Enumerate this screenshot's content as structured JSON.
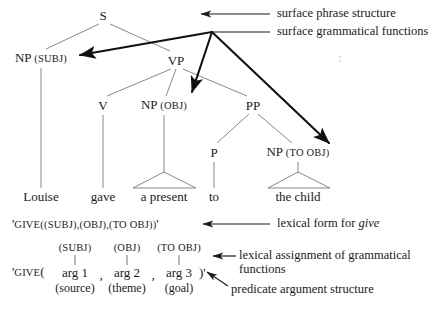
{
  "figure": {
    "type": "lfg-phrase-structure-diagram",
    "colors": {
      "ink": "#1a1a1a",
      "thin_line": "#7a7a7a",
      "thick_line": "#111111",
      "background": "#ffffff"
    }
  },
  "tree": {
    "nodes": [
      {
        "id": "S",
        "label": "S",
        "gf": "",
        "x": 103,
        "y": 15
      },
      {
        "id": "NP_SUBJ",
        "label": "NP",
        "gf": "(SUBJ)",
        "x": 41,
        "y": 58
      },
      {
        "id": "VP",
        "label": "VP",
        "gf": "",
        "x": 176,
        "y": 60
      },
      {
        "id": "V",
        "label": "V",
        "gf": "",
        "x": 103,
        "y": 105
      },
      {
        "id": "NP_OBJ",
        "label": "NP",
        "gf": "(OBJ)",
        "x": 164,
        "y": 105
      },
      {
        "id": "PP",
        "label": "PP",
        "gf": "",
        "x": 253,
        "y": 105
      },
      {
        "id": "P",
        "label": "P",
        "gf": "",
        "x": 214,
        "y": 152
      },
      {
        "id": "NP_TOOBJ",
        "label": "NP",
        "gf": "(TO OBJ)",
        "x": 298,
        "y": 152
      }
    ],
    "words": [
      {
        "id": "w_louise",
        "text": "Louise",
        "x": 41,
        "y": 196
      },
      {
        "id": "w_gave",
        "text": "gave",
        "x": 103,
        "y": 196
      },
      {
        "id": "w_present",
        "text": "a present",
        "x": 164,
        "y": 196
      },
      {
        "id": "w_to",
        "text": "to",
        "x": 214,
        "y": 196
      },
      {
        "id": "w_child",
        "text": "the child",
        "x": 298,
        "y": 196
      }
    ]
  },
  "lexical_form": {
    "prefix": "'",
    "predicate": "GIVE",
    "args": "((SUBJ),(OBJ),(TO OBJ))",
    "suffix": "'",
    "x": 12,
    "y": 224
  },
  "predicate_argument_structure": {
    "prefix": "'",
    "predicate": "GIVE",
    "open_paren": "(",
    "close_paren": ")",
    "suffix": "'",
    "separator": ",",
    "x": 12,
    "y": 272,
    "columns": [
      {
        "gf": "(SUBJ)",
        "arg": "arg 1",
        "role": "(source)",
        "x": 75
      },
      {
        "gf": "(OBJ)",
        "arg": "arg 2",
        "role": "(theme)",
        "x": 127
      },
      {
        "gf": "(TO OBJ)",
        "arg": "arg 3",
        "role": "(goal)",
        "x": 179
      }
    ],
    "gf_row_y": 248,
    "arg_row_y": 272,
    "role_row_y": 288
  },
  "annotations": [
    {
      "id": "surface-phrase-structure",
      "text": "surface phrase structure",
      "x": 277,
      "y": 14
    },
    {
      "id": "surface-grammatical-functions",
      "text": "surface grammatical functions",
      "x": 277,
      "y": 32
    },
    {
      "id": "lexical-form",
      "text_before": "lexical form for ",
      "text_italic": "give",
      "x": 277,
      "y": 224
    },
    {
      "id": "lexical-assignment",
      "line1": "lexical assignment of grammatical",
      "line2": "functions",
      "x": 239,
      "y": 262
    },
    {
      "id": "predicate-argument-structure",
      "text": "predicate argument structure",
      "x": 231,
      "y": 290
    }
  ],
  "colon_mark": {
    "text": ":",
    "x": 340,
    "y": 58
  }
}
